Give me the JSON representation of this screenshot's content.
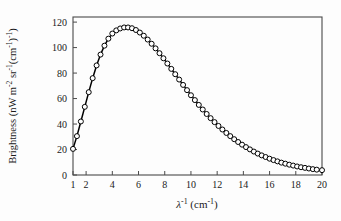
{
  "chart_data": {
    "type": "line",
    "title": "",
    "subtitle": "",
    "xlabel": "λ⁻¹  (cm⁻¹)",
    "ylabel": "Brightness  (nW m⁻² sr⁻¹(cm⁻¹)⁻¹)",
    "xlim": [
      1,
      20
    ],
    "ylim": [
      0,
      124
    ],
    "grid": false,
    "legend": null,
    "marker": "open-circle",
    "line_color": "#000000",
    "marker_fill": "#ffffff",
    "marker_edge": "#000000",
    "xticks": [
      1,
      2,
      4,
      6,
      8,
      10,
      12,
      14,
      16,
      18,
      20
    ],
    "xtick_labels": [
      "1",
      "2",
      "4",
      "6",
      "8",
      "10",
      "12",
      "14",
      "16",
      "18",
      "20"
    ],
    "yticks": [
      0,
      20,
      40,
      60,
      80,
      100,
      120
    ],
    "ytick_labels": [
      "0",
      "20",
      "40",
      "60",
      "80",
      "100",
      "120"
    ],
    "series": [
      {
        "name": "CMB blackbody spectrum",
        "x": [
          1.0,
          1.3,
          1.6,
          1.9,
          2.2,
          2.5,
          2.8,
          3.1,
          3.4,
          3.7,
          4.0,
          4.3,
          4.6,
          4.9,
          5.2,
          5.5,
          5.8,
          6.1,
          6.4,
          6.7,
          7.0,
          7.3,
          7.6,
          7.9,
          8.2,
          8.5,
          8.8,
          9.1,
          9.4,
          9.7,
          10.0,
          10.3,
          10.6,
          10.9,
          11.2,
          11.5,
          11.8,
          12.1,
          12.4,
          12.7,
          13.0,
          13.3,
          13.6,
          13.9,
          14.2,
          14.5,
          14.8,
          15.1,
          15.4,
          15.7,
          16.0,
          16.3,
          16.6,
          16.9,
          17.2,
          17.5,
          17.8,
          18.1,
          18.4,
          18.7,
          19.0,
          19.3,
          19.6,
          20.0
        ],
        "y": [
          20.5,
          30.5,
          42.0,
          53.5,
          65.0,
          76.0,
          86.0,
          94.5,
          101.5,
          107.0,
          111.0,
          113.5,
          115.0,
          115.8,
          115.8,
          115.2,
          113.8,
          111.8,
          109.3,
          106.3,
          103.0,
          99.4,
          95.6,
          91.6,
          87.5,
          83.3,
          79.1,
          74.9,
          70.7,
          66.6,
          62.6,
          58.8,
          55.0,
          51.4,
          47.9,
          44.6,
          41.5,
          38.5,
          35.7,
          33.0,
          30.5,
          28.1,
          25.9,
          23.8,
          21.9,
          20.1,
          18.4,
          16.8,
          15.4,
          14.1,
          12.8,
          11.7,
          10.7,
          9.7,
          8.9,
          8.1,
          7.4,
          6.7,
          6.1,
          5.6,
          5.1,
          4.6,
          4.2,
          3.8
        ]
      }
    ]
  },
  "figure": {
    "caption": ""
  }
}
